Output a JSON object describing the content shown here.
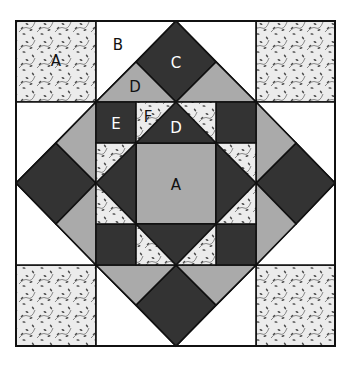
{
  "diagram": {
    "colors": {
      "dark": "#333333",
      "medium": "#aaaaaa",
      "light": "#ffffff",
      "print_bg": "#ececec",
      "print_motif": "#555555",
      "outline": "#111111"
    },
    "labels": {
      "corner_a": "A",
      "b": "B",
      "c": "C",
      "d_top": "D",
      "e": "E",
      "f": "F",
      "d_inner": "D",
      "center_a": "A"
    }
  }
}
